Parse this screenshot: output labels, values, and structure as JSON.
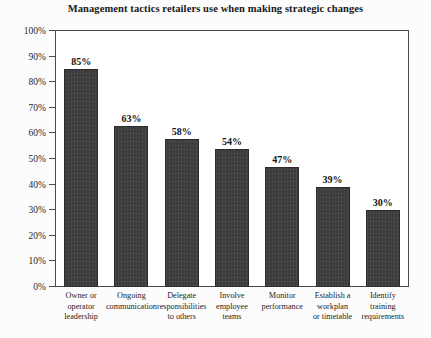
{
  "chart_data": {
    "type": "bar",
    "title": "Management tactics retailers use when making strategic changes",
    "xlabel": "",
    "ylabel": "",
    "ylim": [
      0,
      100
    ],
    "yticks": [
      "0%",
      "10%",
      "20%",
      "30%",
      "40%",
      "50%",
      "60%",
      "70%",
      "80%",
      "90%",
      "100%"
    ],
    "ytick_values": [
      0,
      10,
      20,
      30,
      40,
      50,
      60,
      70,
      80,
      90,
      100
    ],
    "grid": false,
    "legend": "none",
    "unit": "%",
    "bar_color": "#3b3b3b",
    "categories": [
      "Owner or operator leadership",
      "Ongoing communication",
      "Delegate responsibilities to others",
      "Involve employee teams",
      "Monitor performance",
      "Establish a workplan or timetable",
      "Identify training requirements"
    ],
    "category_lines": [
      [
        "Owner or",
        "operator",
        "leadership"
      ],
      [
        "Ongoing",
        "communication"
      ],
      [
        "Delegate",
        "responsibilities",
        "to others"
      ],
      [
        "Involve",
        "employee",
        "teams"
      ],
      [
        "Monitor",
        "performance"
      ],
      [
        "Establish a",
        "workplan",
        "or timetable"
      ],
      [
        "Identify",
        "training",
        "requirements"
      ]
    ],
    "values": [
      85,
      63,
      58,
      54,
      47,
      39,
      30
    ],
    "data_labels": [
      "85%",
      "63%",
      "58%",
      "54%",
      "47%",
      "39%",
      "30%"
    ]
  }
}
